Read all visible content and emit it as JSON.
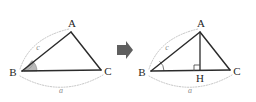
{
  "figure": {
    "background_color": "#ffffff",
    "stroke_color": "#2b2b2b",
    "label_color": "#262626",
    "measure_color": "#b5b5b5",
    "angle_fill_color": "#b9b9b9",
    "arrow_color": "#5f5f5f",
    "transform_arrow": {
      "icon": "right-arrow-icon",
      "direction": "right"
    },
    "panels": [
      {
        "id": "left-panel",
        "name": "triangle-abc-plain",
        "vertices": [
          {
            "key": "A",
            "label": "A",
            "x": 72,
            "y": 27
          },
          {
            "key": "B",
            "label": "B",
            "x": 18,
            "y": 72
          },
          {
            "key": "C",
            "label": "C",
            "x": 104,
            "y": 71
          }
        ],
        "side_labels": [
          {
            "key": "c",
            "label": "c",
            "x": 38,
            "y": 47,
            "side": "AB"
          },
          {
            "key": "a",
            "label": "a",
            "x": 61,
            "y": 91,
            "side": "BC"
          }
        ],
        "angle_marks": [
          {
            "at": "B",
            "style": "filled-sector",
            "name": "angle-b-filled"
          }
        ]
      },
      {
        "id": "right-panel",
        "name": "triangle-abc-with-altitude",
        "vertices": [
          {
            "key": "A",
            "label": "A",
            "x": 201,
            "y": 27
          },
          {
            "key": "B",
            "label": "B",
            "x": 147,
            "y": 72
          },
          {
            "key": "C",
            "label": "C",
            "x": 233,
            "y": 71
          },
          {
            "key": "H",
            "label": "H",
            "x": 201,
            "y": 72
          }
        ],
        "side_labels": [
          {
            "key": "c",
            "label": "c",
            "x": 167,
            "y": 47,
            "side": "AB"
          },
          {
            "key": "a",
            "label": "a",
            "x": 190,
            "y": 91,
            "side": "BC"
          }
        ],
        "angle_marks": [
          {
            "at": "B",
            "style": "thin-arc",
            "name": "angle-b-arc"
          },
          {
            "at": "H",
            "style": "right-angle-square",
            "name": "right-angle-h"
          }
        ]
      }
    ]
  }
}
